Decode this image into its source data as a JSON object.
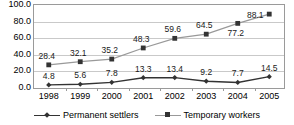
{
  "chart_data": {
    "type": "line",
    "title": "",
    "xlabel": "",
    "ylabel": "",
    "ylim": [
      0.0,
      100.0
    ],
    "yticks": [
      "0.0",
      "20.0",
      "40.0",
      "60.0",
      "80.0",
      "100.0"
    ],
    "grid": true,
    "legend_position": "bottom",
    "categories": [
      "1998",
      "1999",
      "2000",
      "2001",
      "2002",
      "2003",
      "2004",
      "2005"
    ],
    "series": [
      {
        "name": "Permanent settlers",
        "marker": "diamond",
        "color": "#333333",
        "values": [
          4.8,
          5.6,
          7.8,
          13.3,
          13.4,
          9.2,
          7.7,
          14.5
        ],
        "labels": [
          "4.8",
          "5.6",
          "7.8",
          "13.3",
          "13.4",
          "9.2",
          "7.7",
          "14.5"
        ]
      },
      {
        "name": "Temporary workers",
        "marker": "square",
        "color": "#999999",
        "values": [
          28.4,
          32.1,
          35.2,
          48.3,
          59.6,
          64.5,
          77.2,
          88.1
        ],
        "labels": [
          "28.4",
          "32.1",
          "35.2",
          "48.3",
          "59.6",
          "64.5",
          "77.2",
          "88.1"
        ]
      }
    ]
  },
  "legend": {
    "items": [
      {
        "label": "Permanent settlers"
      },
      {
        "label": "Temporary workers"
      }
    ]
  }
}
